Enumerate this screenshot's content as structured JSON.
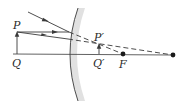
{
  "diagram": {
    "type": "convex-mirror-ray-diagram",
    "labels": {
      "object_tip": "P",
      "object_base": "Q",
      "image_tip": "P′",
      "image_base": "Q′",
      "focal_point": "F"
    },
    "colors": {
      "line": "#3a3a3a",
      "mirror_shade": "#d9d9d9",
      "background": "#ffffff"
    },
    "points": {
      "object_tip": [
        17,
        32
      ],
      "object_base": [
        17,
        54
      ],
      "image_tip": [
        99,
        44
      ],
      "image_base": [
        99,
        54
      ],
      "focal_point": [
        123,
        54
      ],
      "center_of_curvature": [
        173,
        55
      ]
    }
  }
}
